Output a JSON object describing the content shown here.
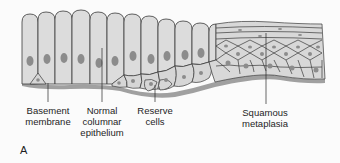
{
  "figure": {
    "panel_letter": "A",
    "labels": [
      {
        "id": "basement-membrane",
        "text": "Basement\nmembrane",
        "x": 48,
        "y": 105,
        "line_x": 48,
        "line_top": 83,
        "line_bottom": 102
      },
      {
        "id": "normal-columnar-epithelium",
        "text": "Normal\ncolumnar\nepithelium",
        "x": 102,
        "y": 105,
        "line_x": 102,
        "line_top": 48,
        "line_bottom": 102
      },
      {
        "id": "reserve-cells",
        "text": "Reserve\ncells",
        "x": 155,
        "y": 105,
        "line_x": 155,
        "line_top": 85,
        "line_bottom": 102
      },
      {
        "id": "squamous-metaplasia",
        "text": "Squamous\nmetaplasia",
        "x": 265,
        "y": 107,
        "line_x": 266,
        "line_top": 33,
        "line_bottom": 104
      }
    ],
    "colors": {
      "cell_fill": "#dcdcdc",
      "cell_stroke": "#3a3a3a",
      "nucleus": "#8a8a8a",
      "basement_membrane": "#9a9a9a",
      "background": "#fbfbfb",
      "text": "#1e1e1e"
    }
  }
}
